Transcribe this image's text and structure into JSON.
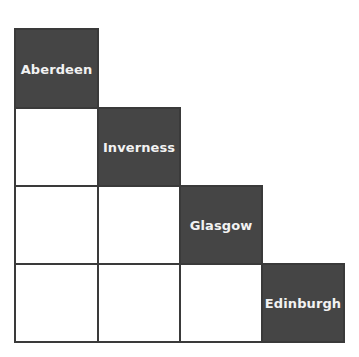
{
  "diagram": {
    "type": "staircase-matrix",
    "rows": 4,
    "cols": 4,
    "colors": {
      "filled": "#454545",
      "empty": "#ffffff",
      "border": "#3a3a3a",
      "label": "#f2f2f2"
    },
    "diagonal": [
      {
        "row": 0,
        "col": 0,
        "label": "Aberdeen"
      },
      {
        "row": 1,
        "col": 1,
        "label": "Inverness"
      },
      {
        "row": 2,
        "col": 2,
        "label": "Glasgow"
      },
      {
        "row": 3,
        "col": 3,
        "label": "Edinburgh"
      }
    ],
    "empty_cells": [
      {
        "row": 1,
        "col": 0
      },
      {
        "row": 2,
        "col": 0
      },
      {
        "row": 2,
        "col": 1
      },
      {
        "row": 3,
        "col": 0
      },
      {
        "row": 3,
        "col": 1
      },
      {
        "row": 3,
        "col": 2
      }
    ]
  }
}
